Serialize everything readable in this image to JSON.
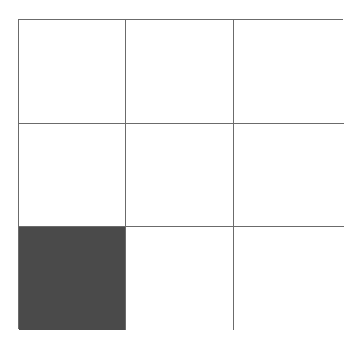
{
  "grid": {
    "rows": 3,
    "columns": 3,
    "line_color": "#6b6b6b",
    "fill_color": "#4a4a4a",
    "cells": [
      {
        "row": 1,
        "col": 1,
        "filled": false
      },
      {
        "row": 1,
        "col": 2,
        "filled": false
      },
      {
        "row": 1,
        "col": 3,
        "filled": false
      },
      {
        "row": 2,
        "col": 1,
        "filled": false
      },
      {
        "row": 2,
        "col": 2,
        "filled": false
      },
      {
        "row": 2,
        "col": 3,
        "filled": false
      },
      {
        "row": 3,
        "col": 1,
        "filled": true
      },
      {
        "row": 3,
        "col": 2,
        "filled": false
      },
      {
        "row": 3,
        "col": 3,
        "filled": false
      }
    ]
  }
}
